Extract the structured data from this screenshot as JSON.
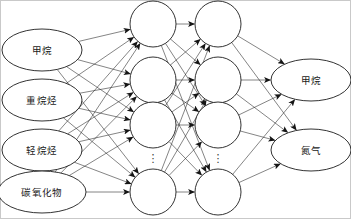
{
  "figure": {
    "background_color": "#ffffff",
    "stroke_color": "#1c1c1c",
    "text_color": "#1a1a1a",
    "frame_color": "#c9c9c9",
    "width": 351,
    "height": 219
  },
  "network": {
    "layer_count": 4,
    "connection_style": "fully-connected",
    "arrow_direction": "left-to-right"
  },
  "input_layer": {
    "name": "input-layer",
    "shape": "ellipse",
    "node_count": 4,
    "nodes": [
      {
        "id": "in-1",
        "label": "甲烷",
        "cx": 42,
        "cy": 50,
        "rx": 40,
        "ry": 21
      },
      {
        "id": "in-2",
        "label": "重烷烃",
        "cx": 42,
        "cy": 100,
        "rx": 40,
        "ry": 21
      },
      {
        "id": "in-3",
        "label": "轻烷烃",
        "cx": 42,
        "cy": 150,
        "rx": 40,
        "ry": 21
      },
      {
        "id": "in-4",
        "label": "碳氧化物",
        "cx": 42,
        "cy": 192,
        "rx": 44,
        "ry": 21
      }
    ]
  },
  "hidden_layer_1": {
    "name": "hidden-layer-1",
    "shape": "circle",
    "visible_node_count": 4,
    "ellipsis": "⋮",
    "nodes": [
      {
        "id": "h1-1",
        "cx": 153,
        "cy": 24,
        "r": 23
      },
      {
        "id": "h1-2",
        "cx": 153,
        "cy": 80,
        "r": 23
      },
      {
        "id": "h1-3",
        "cx": 153,
        "cy": 125,
        "r": 23
      },
      {
        "id": "h1-4",
        "cx": 153,
        "cy": 192,
        "r": 23
      }
    ],
    "ellipsis_pos": {
      "cx": 153,
      "cy": 158
    }
  },
  "hidden_layer_2": {
    "name": "hidden-layer-2",
    "shape": "circle",
    "visible_node_count": 4,
    "ellipsis": "⋮",
    "nodes": [
      {
        "id": "h2-1",
        "cx": 218,
        "cy": 24,
        "r": 23
      },
      {
        "id": "h2-2",
        "cx": 218,
        "cy": 80,
        "r": 23
      },
      {
        "id": "h2-3",
        "cx": 218,
        "cy": 125,
        "r": 23
      },
      {
        "id": "h2-4",
        "cx": 218,
        "cy": 192,
        "r": 23
      }
    ],
    "ellipsis_pos": {
      "cx": 218,
      "cy": 158
    }
  },
  "output_layer": {
    "name": "output-layer",
    "shape": "ellipse",
    "node_count": 2,
    "nodes": [
      {
        "id": "out-1",
        "label": "甲烷",
        "cx": 311,
        "cy": 80,
        "rx": 40,
        "ry": 21
      },
      {
        "id": "out-2",
        "label": "氮气",
        "cx": 311,
        "cy": 150,
        "rx": 40,
        "ry": 21
      }
    ]
  }
}
